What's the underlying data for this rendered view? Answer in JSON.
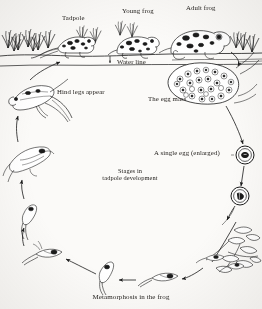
{
  "figure": {
    "caption": "Metamorphosis in the frog",
    "center_note_line1": "Stages in",
    "center_note_line2": "tadpole development",
    "ink_color": "#1b1b1b",
    "paper_color": "#fbfaf8"
  },
  "labels": {
    "tadpole": "Tadpole",
    "young_frog": "Young frog",
    "adult_frog": "Adult frog",
    "water_line": "Water line",
    "hind_legs": "Hind legs appear",
    "egg_mass": "The egg mass",
    "single_egg": "A single egg (enlarged)"
  },
  "stages": [
    {
      "name": "the-egg-mass",
      "label": "The egg mass"
    },
    {
      "name": "a-single-egg",
      "label": "A single egg (enlarged)"
    },
    {
      "name": "dividing-egg",
      "label": ""
    },
    {
      "name": "hatchlings-on-plant",
      "label": ""
    },
    {
      "name": "early-tadpole",
      "label": ""
    },
    {
      "name": "swimming-tadpole",
      "label": ""
    },
    {
      "name": "tadpole-with-gills",
      "label": ""
    },
    {
      "name": "hind-legs-appear",
      "label": "Hind legs appear"
    },
    {
      "name": "four-legged-tadpole",
      "label": ""
    },
    {
      "name": "tadpole-froglet",
      "label": "Tadpole"
    },
    {
      "name": "young-frog",
      "label": "Young frog"
    },
    {
      "name": "adult-frog",
      "label": "Adult frog"
    }
  ]
}
